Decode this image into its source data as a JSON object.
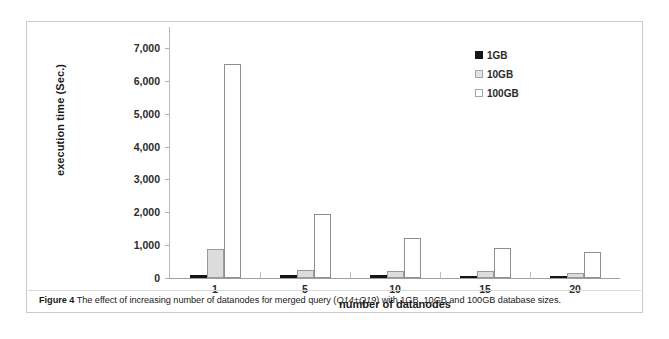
{
  "figure": {
    "caption_prefix": "Figure 4",
    "caption_part1": " The effect of increasing number of datanodes for merged query (",
    "caption_emphasis": "Q14+Q19",
    "caption_part2": ") with 1GB, 10GB and 100GB database sizes."
  },
  "legend": {
    "items": [
      {
        "label": "1GB",
        "swatch": "filled-black-square-icon"
      },
      {
        "label": "10GB",
        "swatch": "light-gray-square-icon"
      },
      {
        "label": "100GB",
        "swatch": "white-square-icon"
      }
    ]
  },
  "chart_data": {
    "type": "bar",
    "title": "",
    "xlabel": "number of datanodes",
    "ylabel": "execution time (Sec.)",
    "categories": [
      "1",
      "5",
      "10",
      "15",
      "20"
    ],
    "series": [
      {
        "name": "1GB",
        "color": "#151515",
        "values": [
          100,
          80,
          80,
          70,
          65
        ]
      },
      {
        "name": "10GB",
        "color": "#dcdcdc",
        "values": [
          880,
          255,
          225,
          200,
          160
        ]
      },
      {
        "name": "100GB",
        "color": "#ffffff",
        "values": [
          6500,
          1960,
          1220,
          910,
          800
        ]
      }
    ],
    "ylim": [
      0,
      7000
    ],
    "yticks": [
      0,
      1000,
      2000,
      3000,
      4000,
      5000,
      6000,
      7000
    ],
    "ytick_labels": [
      "0",
      "1,000",
      "2,000",
      "3,000",
      "4,000",
      "5,000",
      "6,000",
      "7,000"
    ],
    "grid": false,
    "legend_position": "top-right"
  }
}
